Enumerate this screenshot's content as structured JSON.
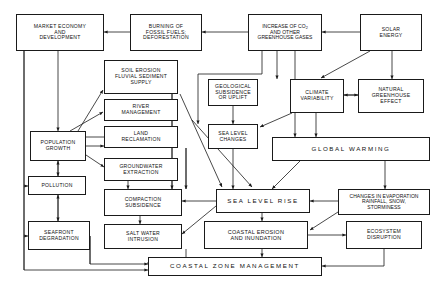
{
  "diagram": {
    "style": {
      "line_color": "#1a1a1a",
      "background": "#ffffff",
      "text_color": "#111111"
    },
    "nodes": [
      {
        "id": "market",
        "label": "MARKET  ECONOMY\nAND\nDEVELOPMENT"
      },
      {
        "id": "burning",
        "label": "BURNING  OF\nFOSSIL  FUELS;\nDEFORESTATION"
      },
      {
        "id": "co2",
        "label": "INCREASE OF CO2\nAND  OTHER\nGREENHOUSE GASES"
      },
      {
        "id": "solar",
        "label": "SOLAR\nENERGY"
      },
      {
        "id": "soil",
        "label": "SOIL  EROSION\nFLUVIAL  SEDIMENT\nSUPPLY"
      },
      {
        "id": "geological",
        "label": "GEOLOGICAL\nSUBSIDENCE\nOR  UPLIFT"
      },
      {
        "id": "climatevar",
        "label": "CLIMATE\nVARIABILITY"
      },
      {
        "id": "natural",
        "label": "NATURAL\nGREENHOUSE\nEFFECT"
      },
      {
        "id": "river",
        "label": "RIVER\nMANAGEMENT"
      },
      {
        "id": "land",
        "label": "LAND\nRECLAMATION"
      },
      {
        "id": "sealevelch",
        "label": "SEA  LEVEL\nCHANGES"
      },
      {
        "id": "population",
        "label": "POPULATION\nGROWTH"
      },
      {
        "id": "groundwater",
        "label": "GROUNDWATER\nEXTRACTION"
      },
      {
        "id": "globalwarm",
        "label": "GLOBAL      WARMING"
      },
      {
        "id": "pollution",
        "label": "POLLUTION"
      },
      {
        "id": "compaction",
        "label": "COMPACTION\nSUBSIDENCE"
      },
      {
        "id": "sealevelrise",
        "label": "SEA    LEVEL    RISE"
      },
      {
        "id": "changes",
        "label": "CHANGES  IN  EVAPORATION\nRAINFALL, SNOW,\nSTORMINESS"
      },
      {
        "id": "saltwater",
        "label": "SALT  WATER\nINTRUSION"
      },
      {
        "id": "coastalero",
        "label": "COASTAL  EROSION\nAND  INUNDATION"
      },
      {
        "id": "ecosystem",
        "label": "ECOSYSTEM\nDISRUPTION"
      },
      {
        "id": "seafront",
        "label": "SEAFRONT\nDEGRADATION"
      },
      {
        "id": "czm",
        "label": "COASTAL    ZONE    MANAGEMENT"
      }
    ]
  }
}
